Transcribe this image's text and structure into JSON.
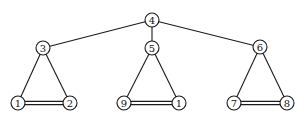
{
  "graph": {
    "title": "",
    "nodes": [
      {
        "id": "n4",
        "label": "4"
      },
      {
        "id": "n3",
        "label": "3"
      },
      {
        "id": "n5",
        "label": "5"
      },
      {
        "id": "n6",
        "label": "6"
      },
      {
        "id": "n1a",
        "label": "1"
      },
      {
        "id": "n2",
        "label": "2"
      },
      {
        "id": "n9",
        "label": "9"
      },
      {
        "id": "n1b",
        "label": "1"
      },
      {
        "id": "n7",
        "label": "7"
      },
      {
        "id": "n8",
        "label": "8"
      }
    ],
    "edges": [
      {
        "from": "n4",
        "to": "n3",
        "type": "single"
      },
      {
        "from": "n4",
        "to": "n5",
        "type": "single"
      },
      {
        "from": "n4",
        "to": "n6",
        "type": "single"
      },
      {
        "from": "n3",
        "to": "n1a",
        "type": "single"
      },
      {
        "from": "n3",
        "to": "n2",
        "type": "single"
      },
      {
        "from": "n1a",
        "to": "n2",
        "type": "double"
      },
      {
        "from": "n5",
        "to": "n9",
        "type": "single"
      },
      {
        "from": "n5",
        "to": "n1b",
        "type": "single"
      },
      {
        "from": "n9",
        "to": "n1b",
        "type": "double"
      },
      {
        "from": "n6",
        "to": "n7",
        "type": "single"
      },
      {
        "from": "n6",
        "to": "n8",
        "type": "single"
      },
      {
        "from": "n7",
        "to": "n8",
        "type": "double"
      }
    ]
  }
}
